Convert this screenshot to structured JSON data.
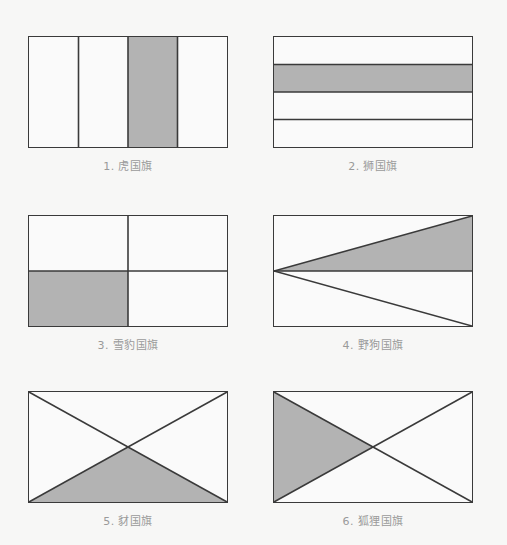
{
  "page": {
    "background_color": "#f7f7f6",
    "title": ""
  },
  "style": {
    "fill_gray": "#b3b3b3",
    "fill_white": "#fafafa",
    "stroke_color": "#3a3a3a",
    "label_color": "#9a9a9a"
  },
  "flags": [
    {
      "number": "1.",
      "name": "虎国旗",
      "label": "1. 虎国旗",
      "pattern": "vertical-stripes",
      "stripe_count": 4,
      "shaded_segments": [
        3
      ],
      "width": 200,
      "height": 112,
      "x": 28,
      "y": 36
    },
    {
      "number": "2.",
      "name": "狮国旗",
      "label": "2. 狮国旗",
      "pattern": "horizontal-stripes",
      "stripe_count": 4,
      "shaded_segments": [
        2
      ],
      "width": 200,
      "height": 112,
      "x": 273,
      "y": 36
    },
    {
      "number": "3.",
      "name": "雪豹国旗",
      "label": "3. 雪豹国旗",
      "pattern": "quadrants",
      "stripe_count": 4,
      "shaded_segments": [
        3
      ],
      "width": 200,
      "height": 112,
      "x": 28,
      "y": 215
    },
    {
      "number": "4.",
      "name": "野狗国旗",
      "label": "4. 野狗国旗",
      "pattern": "left-apex-triangles",
      "stripe_count": 2,
      "shaded_segments": [
        1
      ],
      "width": 200,
      "height": 112,
      "x": 273,
      "y": 215
    },
    {
      "number": "5.",
      "name": "豺国旗",
      "label": "5. 豺国旗",
      "pattern": "saltire",
      "stripe_count": 4,
      "shaded_segments": [
        3
      ],
      "width": 200,
      "height": 112,
      "x": 28,
      "y": 391
    },
    {
      "number": "6.",
      "name": "狐狸国旗",
      "label": "6. 狐狸国旗",
      "pattern": "saltire",
      "stripe_count": 4,
      "shaded_segments": [
        4
      ],
      "width": 200,
      "height": 112,
      "x": 273,
      "y": 391
    }
  ]
}
